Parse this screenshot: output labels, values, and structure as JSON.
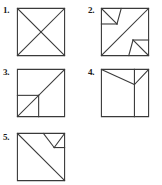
{
  "sheet": {
    "title": "Numbered square dissection figures",
    "background_color": "#ffffff",
    "stroke_color": "#3a3a3a",
    "label_color": "#1a1a1a",
    "figure_count": 5
  },
  "figures": [
    {
      "id": "figure-1",
      "label": "1.",
      "description": "Square with both diagonals drawn forming an X",
      "box": {
        "x": 16,
        "y": 7,
        "w": 50,
        "h": 50
      },
      "label_pos": {
        "x": 3,
        "y": 6
      },
      "lines": [
        {
          "name": "diagonal-main",
          "x1": 0,
          "y1": 0,
          "x2": 100,
          "y2": 100
        },
        {
          "name": "diagonal-anti",
          "x1": 100,
          "y1": 0,
          "x2": 0,
          "y2": 100
        }
      ]
    },
    {
      "id": "figure-2",
      "label": "2.",
      "description": "Square with anti-diagonal plus small notch triangles at top-left and bottom-right",
      "box": {
        "x": 100,
        "y": 7,
        "w": 50,
        "h": 50
      },
      "label_pos": {
        "x": 88,
        "y": 6
      },
      "lines": [
        {
          "name": "diagonal-anti",
          "x1": 100,
          "y1": 0,
          "x2": 0,
          "y2": 100
        },
        {
          "name": "notch-top-left-a",
          "x1": 0,
          "y1": 0,
          "x2": 33,
          "y2": 33
        },
        {
          "name": "notch-top-left-b",
          "x1": 33,
          "y1": 33,
          "x2": 42,
          "y2": 0
        },
        {
          "name": "notch-top-left-c",
          "x1": 0,
          "y1": 33,
          "x2": 33,
          "y2": 33
        },
        {
          "name": "notch-bottom-right-a",
          "x1": 100,
          "y1": 100,
          "x2": 67,
          "y2": 67
        },
        {
          "name": "notch-bottom-right-b",
          "x1": 67,
          "y1": 67,
          "x2": 58,
          "y2": 100
        },
        {
          "name": "notch-bottom-right-c",
          "x1": 67,
          "y1": 67,
          "x2": 100,
          "y2": 67
        }
      ]
    },
    {
      "id": "figure-3",
      "label": "3.",
      "description": "Square with main diagonal, a horizontal segment from left edge to the diagonal and a vertical segment down to the base",
      "box": {
        "x": 16,
        "y": 68,
        "w": 50,
        "h": 50
      },
      "label_pos": {
        "x": 3,
        "y": 68
      },
      "lines": [
        {
          "name": "diagonal-main",
          "x1": 0,
          "y1": 100,
          "x2": 100,
          "y2": 0
        },
        {
          "name": "horizontal-left",
          "x1": 0,
          "y1": 55,
          "x2": 45,
          "y2": 55
        },
        {
          "name": "vertical-down",
          "x1": 45,
          "y1": 55,
          "x2": 45,
          "y2": 100
        }
      ]
    },
    {
      "id": "figure-4",
      "label": "4.",
      "description": "Square with a V shape from the top corners meeting at a vertex and a full-height vertical line through that vertex",
      "box": {
        "x": 100,
        "y": 68,
        "w": 50,
        "h": 50
      },
      "label_pos": {
        "x": 88,
        "y": 68
      },
      "lines": [
        {
          "name": "vee-left-arm",
          "x1": 0,
          "y1": 0,
          "x2": 70,
          "y2": 32
        },
        {
          "name": "vee-right-arm",
          "x1": 70,
          "y1": 32,
          "x2": 100,
          "y2": 0
        },
        {
          "name": "vertical-through-vertex",
          "x1": 70,
          "y1": 0,
          "x2": 70,
          "y2": 100
        }
      ]
    },
    {
      "id": "figure-5",
      "label": "5.",
      "description": "Square with main diagonal plus a small notched triangle at the top-right corner",
      "box": {
        "x": 16,
        "y": 132,
        "w": 50,
        "h": 50
      },
      "label_pos": {
        "x": 3,
        "y": 133
      },
      "lines": [
        {
          "name": "diagonal-main",
          "x1": 0,
          "y1": 0,
          "x2": 100,
          "y2": 100
        },
        {
          "name": "notch-left-arm",
          "x1": 55,
          "y1": 0,
          "x2": 78,
          "y2": 30
        },
        {
          "name": "notch-right-arm",
          "x1": 78,
          "y1": 30,
          "x2": 100,
          "y2": 0
        },
        {
          "name": "notch-base",
          "x1": 78,
          "y1": 30,
          "x2": 100,
          "y2": 30
        }
      ]
    }
  ]
}
